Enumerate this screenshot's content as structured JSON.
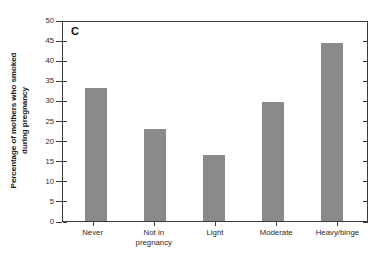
{
  "chart_data": {
    "type": "bar",
    "title": "",
    "panel_label": "C",
    "xlabel": "",
    "ylabel": "Percentage of mothers who smoked during pregnancy",
    "ylabel_line1": "Percentage of mothers who smoked",
    "ylabel_line2": "during pregnancy",
    "categories": [
      "Never",
      "Not in pregnancy",
      "Light",
      "Moderate",
      "Heavy/binge"
    ],
    "category_lines": [
      [
        "Never"
      ],
      [
        "Not in",
        "pregnancy"
      ],
      [
        "Light"
      ],
      [
        "Moderate"
      ],
      [
        "Heavy/binge"
      ]
    ],
    "values": [
      33.2,
      22.9,
      16.4,
      29.6,
      44.2
    ],
    "ylim": [
      0,
      50
    ],
    "ytick_values": [
      0,
      5,
      10,
      15,
      20,
      25,
      30,
      35,
      40,
      45,
      50
    ],
    "ytick_labels": [
      "0",
      "5",
      "10",
      "15",
      "20",
      "25",
      "30",
      "35",
      "40",
      "45",
      "50"
    ],
    "grid": false,
    "legend": null,
    "bar_color": "#8a8a8a",
    "axis_color": "#3b3b3b",
    "background": "#ffffff"
  },
  "axis": {
    "y": {
      "labels": [
        "50",
        "45",
        "40",
        "35",
        "30",
        "25",
        "20",
        "15",
        "10",
        "5",
        "0"
      ]
    }
  }
}
